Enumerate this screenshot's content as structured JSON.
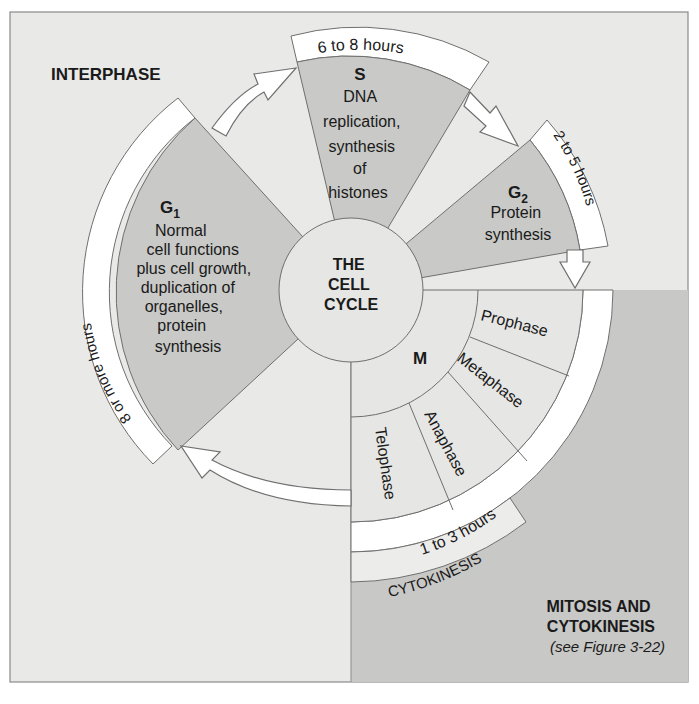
{
  "colors": {
    "page_bg": "#ffffff",
    "panel_bg": "#e9e9e7",
    "mitosis_bg": "#c8c8c6",
    "wedge_fill": "#c9c9c7",
    "band_fill": "#ffffff",
    "stroke": "#6f6f6f",
    "text": "#1a1a1a"
  },
  "labels": {
    "interphase": "INTERPHASE",
    "center": [
      "THE",
      "CELL",
      "CYCLE"
    ],
    "mitosis_title": [
      "MITOSIS AND",
      "CYTOKINESIS"
    ],
    "mitosis_ref": "(see Figure 3-22)"
  },
  "phases": {
    "g1": {
      "name": "G",
      "sub": "1",
      "desc": [
        "Normal",
        "cell functions",
        "plus cell growth,",
        "duplication of",
        "organelles,",
        "protein",
        "synthesis"
      ],
      "duration": "8 or more hours"
    },
    "s": {
      "name": "S",
      "desc": [
        "DNA",
        "replication,",
        "synthesis",
        "of",
        "histones"
      ],
      "duration": "6 to 8 hours"
    },
    "g2": {
      "name": "G",
      "sub": "2",
      "desc": [
        "Protein",
        "synthesis"
      ],
      "duration": "2 to 5 hours"
    },
    "m": {
      "name": "M",
      "stages": [
        "Prophase",
        "Metaphase",
        "Anaphase",
        "Telophase"
      ],
      "duration": "1 to 3 hours",
      "cytokinesis": "CYTOKINESIS"
    }
  }
}
